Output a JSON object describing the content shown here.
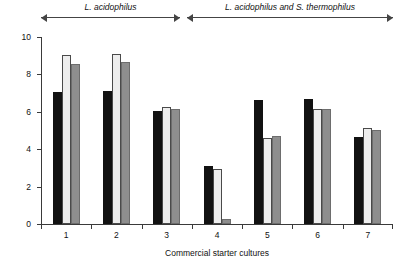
{
  "annotations": [
    {
      "name": "group-label-acidophilus",
      "text": "L. acidophilus",
      "left_pct": 0,
      "right_pct": 39.5
    },
    {
      "name": "group-label-acidophilus-thermophilus",
      "text": "L. acidophilus and S. thermophilus",
      "left_pct": 41.5,
      "right_pct": 100
    }
  ],
  "chart_data": {
    "type": "bar",
    "title": "",
    "xlabel": "Commercial starter cultures",
    "ylabel": "Log10 count (cfu g-1)",
    "ylabel_parts": {
      "prefix": "Log",
      "sub": "10",
      "mid": " count (cfu g",
      "sup": "−1",
      "suffix": ")"
    },
    "categories": [
      "1",
      "2",
      "3",
      "4",
      "5",
      "6",
      "7"
    ],
    "ylim": [
      0,
      10
    ],
    "yticks": [
      0,
      2,
      4,
      6,
      8,
      10
    ],
    "ytick_labels": [
      "0",
      "2",
      "4",
      "6",
      "8",
      "10"
    ],
    "grid": false,
    "legend": "none",
    "series": [
      {
        "name": "black-bar",
        "color": "#121212",
        "values": [
          7.0,
          7.05,
          6.0,
          3.05,
          6.6,
          6.65,
          4.6
        ]
      },
      {
        "name": "light-bar",
        "color": "#eeeeee",
        "values": [
          9.0,
          9.05,
          6.2,
          2.9,
          4.55,
          6.1,
          5.1
        ]
      },
      {
        "name": "gray-bar",
        "color": "#8e8e8e",
        "values": [
          8.5,
          8.6,
          6.1,
          0.2,
          4.65,
          6.1,
          5.0
        ]
      }
    ],
    "group_spacing_note": "7 groups of 3 adjacent bars"
  }
}
